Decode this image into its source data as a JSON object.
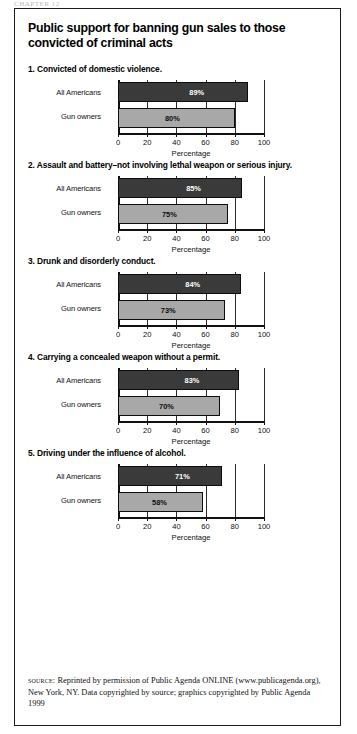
{
  "running_head": "CHAPTER 12",
  "figure": {
    "title": "Public support for banning gun sales to those convicted of criminal acts",
    "source_kicker": "source:",
    "source_text": " Reprinted by permission of Public Agenda ONLINE (www.publicagenda.org), New York, NY. Data copyrighted by source; graphics copyrighted by Public Agenda 1999"
  },
  "chart_data": [
    {
      "type": "bar",
      "orientation": "horizontal",
      "panel_number": "1.",
      "title": "1. Convicted of domestic violence.",
      "categories": [
        "All Americans",
        "Gun owners"
      ],
      "values": [
        89,
        80
      ],
      "value_labels": [
        "89%",
        "80%"
      ],
      "xlabel": "Percentage",
      "ylabel": "",
      "xlim": [
        0,
        100
      ],
      "xticks": [
        0,
        20,
        40,
        60,
        80,
        100
      ],
      "xtick_labels": [
        "0",
        "20",
        "40",
        "60",
        "80",
        "100"
      ],
      "grid": true,
      "legend": "none",
      "colors": [
        "#3a3a3a",
        "#a8a8a8"
      ]
    },
    {
      "type": "bar",
      "orientation": "horizontal",
      "panel_number": "2.",
      "title": "2. Assault and battery–not involving lethal weapon or serious injury.",
      "categories": [
        "All Americans",
        "Gun owners"
      ],
      "values": [
        85,
        75
      ],
      "value_labels": [
        "85%",
        "75%"
      ],
      "xlabel": "Percentage",
      "ylabel": "",
      "xlim": [
        0,
        100
      ],
      "xticks": [
        0,
        20,
        40,
        60,
        80,
        100
      ],
      "xtick_labels": [
        "0",
        "20",
        "40",
        "60",
        "80",
        "100"
      ],
      "grid": true,
      "legend": "none",
      "colors": [
        "#3a3a3a",
        "#a8a8a8"
      ]
    },
    {
      "type": "bar",
      "orientation": "horizontal",
      "panel_number": "3.",
      "title": "3. Drunk and disorderly conduct.",
      "categories": [
        "All Americans",
        "Gun owners"
      ],
      "values": [
        84,
        73
      ],
      "value_labels": [
        "84%",
        "73%"
      ],
      "xlabel": "Percentage",
      "ylabel": "",
      "xlim": [
        0,
        100
      ],
      "xticks": [
        0,
        20,
        40,
        60,
        80,
        100
      ],
      "xtick_labels": [
        "0",
        "20",
        "40",
        "60",
        "80",
        "100"
      ],
      "grid": true,
      "legend": "none",
      "colors": [
        "#3a3a3a",
        "#a8a8a8"
      ]
    },
    {
      "type": "bar",
      "orientation": "horizontal",
      "panel_number": "4.",
      "title": "4. Carrying a concealed weapon without a permit.",
      "categories": [
        "All Americans",
        "Gun owners"
      ],
      "values": [
        83,
        70
      ],
      "value_labels": [
        "83%",
        "70%"
      ],
      "xlabel": "Percentage",
      "ylabel": "",
      "xlim": [
        0,
        100
      ],
      "xticks": [
        0,
        20,
        40,
        60,
        80,
        100
      ],
      "xtick_labels": [
        "0",
        "20",
        "40",
        "60",
        "80",
        "100"
      ],
      "grid": true,
      "legend": "none",
      "colors": [
        "#3a3a3a",
        "#a8a8a8"
      ]
    },
    {
      "type": "bar",
      "orientation": "horizontal",
      "panel_number": "5.",
      "title": "5. Driving under the influence of alcohol.",
      "categories": [
        "All Americans",
        "Gun owners"
      ],
      "values": [
        71,
        58
      ],
      "value_labels": [
        "71%",
        "58%"
      ],
      "xlabel": "Percentage",
      "ylabel": "",
      "xlim": [
        0,
        100
      ],
      "xticks": [
        0,
        20,
        40,
        60,
        80,
        100
      ],
      "xtick_labels": [
        "0",
        "20",
        "40",
        "60",
        "80",
        "100"
      ],
      "grid": true,
      "legend": "none",
      "colors": [
        "#3a3a3a",
        "#a8a8a8"
      ]
    }
  ]
}
